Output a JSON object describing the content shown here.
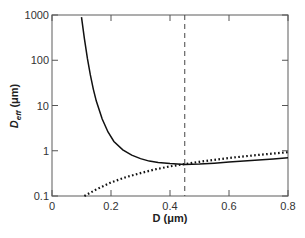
{
  "chart_data": {
    "type": "line",
    "title": "",
    "xlabel": "D (μm)",
    "ylabel_main": "D",
    "ylabel_sub": "eff",
    "ylabel_units": " (μm)",
    "xlim": [
      0,
      0.8
    ],
    "ylim": [
      0.1,
      1000
    ],
    "yscale": "log",
    "grid": false,
    "legend": "none",
    "x_ticks": [
      0,
      0.2,
      0.4,
      0.6,
      0.8
    ],
    "x_tick_labels": [
      "0",
      "0.2",
      "0.4",
      "0.6",
      "0.8"
    ],
    "y_ticks": [
      0.1,
      1,
      10,
      100,
      1000
    ],
    "y_tick_labels": [
      "0.1",
      "1",
      "10",
      "100",
      "1000"
    ],
    "vertical_line": {
      "x": 0.45,
      "style": "dashed"
    },
    "series": [
      {
        "name": "solid",
        "style": "solid",
        "x": [
          0.1,
          0.11,
          0.12,
          0.13,
          0.14,
          0.15,
          0.17,
          0.19,
          0.21,
          0.24,
          0.27,
          0.3,
          0.33,
          0.36,
          0.4,
          0.45,
          0.5,
          0.55,
          0.6,
          0.65,
          0.7,
          0.75,
          0.8
        ],
        "y": [
          900,
          300,
          110,
          48,
          23,
          12.5,
          5.0,
          2.6,
          1.6,
          1.05,
          0.8,
          0.67,
          0.59,
          0.55,
          0.52,
          0.5,
          0.51,
          0.53,
          0.56,
          0.59,
          0.62,
          0.66,
          0.7
        ]
      },
      {
        "name": "dotted",
        "style": "dotted",
        "x": [
          0.11,
          0.15,
          0.2,
          0.25,
          0.3,
          0.35,
          0.4,
          0.45,
          0.5,
          0.55,
          0.6,
          0.65,
          0.7,
          0.75,
          0.8
        ],
        "y": [
          0.1,
          0.14,
          0.2,
          0.26,
          0.32,
          0.39,
          0.45,
          0.51,
          0.57,
          0.63,
          0.69,
          0.75,
          0.81,
          0.87,
          0.93
        ]
      }
    ]
  }
}
